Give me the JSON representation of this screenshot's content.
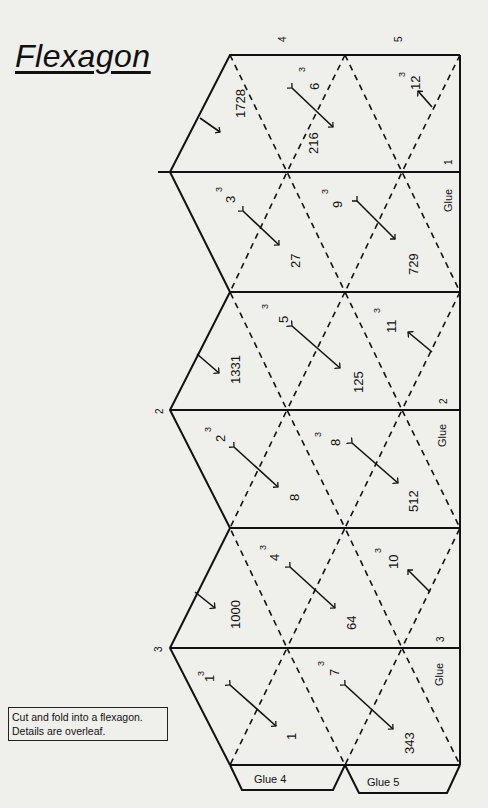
{
  "title": "Flexagon",
  "note": {
    "line1": "Cut and fold into a flexagon.",
    "line2": "Details are overleaf."
  },
  "edge_labels": {
    "top_4": "4",
    "top_5": "5",
    "left_2": "2",
    "left_3": "3",
    "glue_1": "1",
    "glue_2": "2",
    "glue_3": "3"
  },
  "glue": {
    "side": "Glue",
    "tab4": "Glue 4",
    "tab5": "Glue 5"
  },
  "faces": [
    {
      "id": "f1728",
      "value": "1728"
    },
    {
      "id": "f6",
      "base": "6",
      "exp": "3"
    },
    {
      "id": "f216",
      "value": "216"
    },
    {
      "id": "f12",
      "base": "12",
      "exp": "3"
    },
    {
      "id": "f3",
      "base": "3",
      "exp": "3"
    },
    {
      "id": "f27",
      "value": "27"
    },
    {
      "id": "f9",
      "base": "9",
      "exp": "3"
    },
    {
      "id": "f729",
      "value": "729"
    },
    {
      "id": "f1331",
      "value": "1331"
    },
    {
      "id": "f5",
      "base": "5",
      "exp": "3"
    },
    {
      "id": "f125",
      "value": "125"
    },
    {
      "id": "f11",
      "base": "11",
      "exp": "3"
    },
    {
      "id": "f2",
      "base": "2",
      "exp": "3"
    },
    {
      "id": "f8a",
      "value": "8"
    },
    {
      "id": "f8b",
      "base": "8",
      "exp": "3"
    },
    {
      "id": "f512",
      "value": "512"
    },
    {
      "id": "f1000",
      "value": "1000"
    },
    {
      "id": "f4",
      "base": "4",
      "exp": "3"
    },
    {
      "id": "f64",
      "value": "64"
    },
    {
      "id": "f10",
      "base": "10",
      "exp": "3"
    },
    {
      "id": "f1",
      "base": "1",
      "exp": "3"
    },
    {
      "id": "f1b",
      "value": "1"
    },
    {
      "id": "f7",
      "base": "7",
      "exp": "3"
    },
    {
      "id": "f343",
      "value": "343"
    }
  ]
}
